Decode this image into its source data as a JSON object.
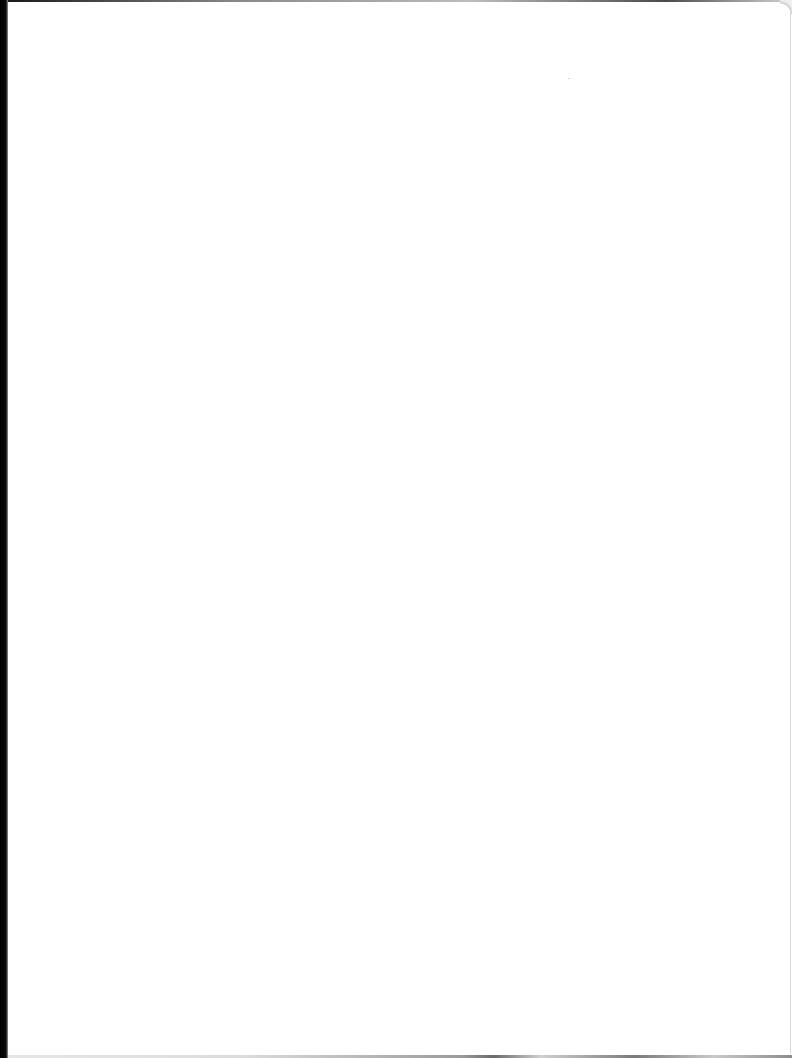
{
  "document": {
    "type": "scanned-page",
    "content": "",
    "background_color": "#ffffff",
    "scan_edge_color": "#000000"
  }
}
